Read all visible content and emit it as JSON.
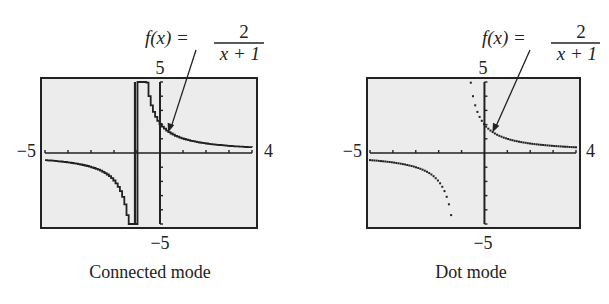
{
  "chart_data": [
    {
      "type": "line",
      "title": "Connected mode",
      "function_label": {
        "lhs": "f(x) =",
        "numerator": "2",
        "denominator": "x + 1"
      },
      "window": {
        "xmin": -5,
        "xmax": 4,
        "ymin": -5,
        "ymax": 5
      },
      "tick_labels": {
        "xmin": "−5",
        "xmax": "4",
        "ymin": "−5",
        "ymax": "5"
      },
      "asymptote_artifact": {
        "x": -1,
        "drawn": true
      },
      "series": [
        {
          "name": "left branch",
          "x": [
            -5,
            -4,
            -3,
            -2,
            -1.5,
            -1.4,
            -1.3
          ],
          "y": [
            -0.5,
            -0.67,
            -1,
            -2,
            -4,
            -5,
            -6.67
          ]
        },
        {
          "name": "right branch",
          "x": [
            -0.6,
            -0.5,
            -0.3,
            0,
            0.5,
            1,
            2,
            3,
            4
          ],
          "y": [
            5,
            4,
            2.86,
            2,
            1.33,
            1,
            0.67,
            0.5,
            0.4
          ]
        }
      ],
      "grid": false,
      "caption": "Connected mode"
    },
    {
      "type": "scatter",
      "title": "Dot mode",
      "function_label": {
        "lhs": "f(x) =",
        "numerator": "2",
        "denominator": "x + 1"
      },
      "window": {
        "xmin": -5,
        "xmax": 4,
        "ymin": -5,
        "ymax": 5
      },
      "tick_labels": {
        "xmin": "−5",
        "xmax": "4",
        "ymin": "−5",
        "ymax": "5"
      },
      "asymptote_artifact": {
        "x": -1,
        "drawn": false
      },
      "series": [
        {
          "name": "left branch",
          "x": [
            -5,
            -4,
            -3,
            -2,
            -1.5,
            -1.4
          ],
          "y": [
            -0.5,
            -0.67,
            -1,
            -2,
            -4,
            -5
          ]
        },
        {
          "name": "right branch",
          "x": [
            -0.6,
            -0.5,
            -0.3,
            0,
            0.5,
            1,
            2,
            3,
            4
          ],
          "y": [
            5,
            4,
            2.86,
            2,
            1.33,
            1,
            0.67,
            0.5,
            0.4
          ]
        }
      ],
      "grid": false,
      "caption": "Dot mode"
    }
  ],
  "panels": [
    {
      "caption": "Connected mode",
      "eq_lhs": "f(x) =",
      "eq_num": "2",
      "eq_den": "x + 1",
      "ymax": "5",
      "ymin": "−5",
      "xmin": "−5",
      "xmax": "4"
    },
    {
      "caption": "Dot mode",
      "eq_lhs": "f(x) =",
      "eq_num": "2",
      "eq_den": "x + 1",
      "ymax": "5",
      "ymin": "−5",
      "xmin": "−5",
      "xmax": "4"
    }
  ]
}
